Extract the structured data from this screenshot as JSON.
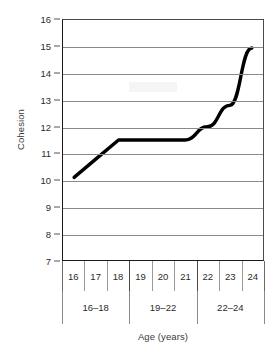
{
  "chart_data": {
    "type": "line",
    "title": "",
    "xlabel": "Age (years)",
    "ylabel": "Cohesion",
    "x": [
      16,
      17,
      18,
      19,
      20,
      21,
      22,
      23,
      24
    ],
    "values": [
      10.1,
      10.8,
      11.5,
      11.5,
      11.5,
      11.5,
      12.0,
      12.8,
      14.95
    ],
    "series": [
      {
        "name": "Cohesion",
        "values": [
          10.1,
          10.8,
          11.5,
          11.5,
          11.5,
          11.5,
          12.0,
          12.8,
          14.95
        ]
      }
    ],
    "xtick_labels": [
      "16",
      "17",
      "18",
      "19",
      "20",
      "21",
      "22",
      "23",
      "24"
    ],
    "ytick_labels": [
      "16",
      "15",
      "14",
      "13",
      "12",
      "11",
      "10",
      "9",
      "8",
      "7"
    ],
    "ytick_values": [
      16,
      15,
      14,
      13,
      12,
      11,
      10,
      9,
      8,
      7
    ],
    "ylim": [
      7,
      16
    ],
    "xlim": [
      16,
      24
    ],
    "grid": "horizontal",
    "legend": "none",
    "line_color": "#000000",
    "grid_color": "#8a8a8a",
    "axis_color": "#1a1a1a",
    "groups": [
      {
        "label": "16–18",
        "start": 16,
        "end": 18
      },
      {
        "label": "19–22",
        "start": 19,
        "end": 21
      },
      {
        "label": "22–24",
        "start": 22,
        "end": 24
      }
    ]
  }
}
